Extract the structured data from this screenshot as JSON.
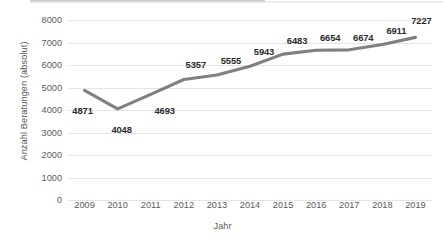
{
  "chart_data": {
    "type": "line",
    "title": "",
    "xlabel": "Jahr",
    "ylabel": "Anzahl Beratungen (absolut)",
    "categories": [
      "2009",
      "2010",
      "2011",
      "2012",
      "2013",
      "2014",
      "2015",
      "2016",
      "2017",
      "2018",
      "2019"
    ],
    "values": [
      4871,
      4048,
      4693,
      5357,
      5555,
      5943,
      6483,
      6654,
      6674,
      6911,
      7227
    ],
    "data_labels": [
      "4871",
      "4048",
      "4693",
      "5357",
      "5555",
      "5943",
      "6483",
      "6654",
      "6674",
      "6911",
      "7227"
    ],
    "ylim": [
      0,
      8000
    ],
    "y_ticks": [
      "0",
      "1000",
      "2000",
      "3000",
      "4000",
      "5000",
      "6000",
      "7000",
      "8000"
    ],
    "y_tick_values": [
      0,
      1000,
      2000,
      3000,
      4000,
      5000,
      6000,
      7000,
      8000
    ],
    "grid": "horizontal",
    "legend": "none",
    "series_color": "#808080",
    "gridline_color": "#E4E4E6",
    "text_color": "#5A5A5A",
    "label_color": "#2B2B2B",
    "label_offsets": [
      {
        "dx": -2,
        "dy": 20
      },
      {
        "dx": 4,
        "dy": 20
      },
      {
        "dx": 14,
        "dy": 16
      },
      {
        "dx": 12,
        "dy": -15
      },
      {
        "dx": 14,
        "dy": -15
      },
      {
        "dx": 14,
        "dy": -15
      },
      {
        "dx": 14,
        "dy": -14
      },
      {
        "dx": 14,
        "dy": -13
      },
      {
        "dx": 14,
        "dy": -13
      },
      {
        "dx": 14,
        "dy": -15
      },
      {
        "dx": 6,
        "dy": -17
      }
    ]
  }
}
